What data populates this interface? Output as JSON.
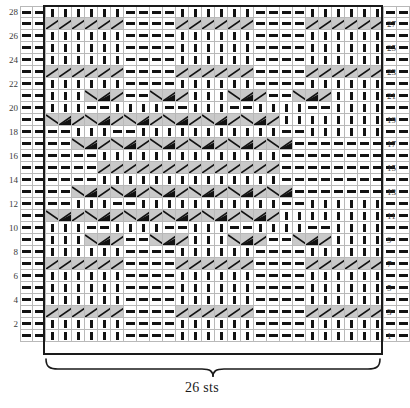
{
  "chart_data": {
    "type": "table",
    "caption": "26 sts",
    "rows_total": 28,
    "columns_total": 30,
    "repeat_columns": 26,
    "repeat_start_column": 3,
    "row_numbers_left": [
      28,
      26,
      24,
      22,
      20,
      18,
      16,
      14,
      12,
      10,
      8,
      6,
      4,
      2
    ],
    "row_numbers_right": [
      27,
      25,
      23,
      21,
      19,
      17,
      15,
      13,
      11,
      9,
      7,
      5,
      3,
      1
    ],
    "xlabel": "26 sts",
    "ylabel": "",
    "grid": true,
    "legend_position": "none",
    "symbol_key": {
      "k": "knit-stitch",
      "p": "purl-stitch",
      "R": "right-traveling-stitch",
      "L": "left-traveling-stitch",
      "RD": "right-twist-dark",
      "LD": "left-twist-dark",
      "b": "blank-gray"
    },
    "colors": {
      "grid_line": "#b9b9b9",
      "repeat_outline": "#1a1a1a",
      "symbol": "#121212",
      "fill_gray": "#c9c9c9",
      "fill_light_gray": "#dedede",
      "fill_white": "#ffffff",
      "text": "#3a3a3a"
    },
    "rows": [
      {
        "n": 28,
        "cells": "pp|kkkkkk|pppp|kkkkkk|pppp|kkkkkk|pp"
      },
      {
        "n": 27,
        "cells": "pp|RRRRRR|pppp|RRRRRR|pppp|RRRRRR|pp"
      },
      {
        "n": 26,
        "cells": "pp|kkkkkk|pppp|kkkkkk|pppp|kkkkkk|pp"
      },
      {
        "n": 25,
        "cells": "pp|kkkkkk|pppp|kkkkkk|pppp|kkkkkk|pp"
      },
      {
        "n": 24,
        "cells": "pp|kkkkkk|pppp|kkkkkk|pppp|kkkkkk|pp"
      },
      {
        "n": 23,
        "cells": "pp|RRRRRR|pppp|RRRRRR|pppp|RRRRRR|pp"
      },
      {
        "n": 22,
        "cells": "pp|kkkkkk|pppp|kkkkkk|pppp|kkkkkk|pp"
      },
      {
        "n": 21,
        "cells": "pp|kkkLDR|ppLDR|kkkLDR|ppLDR|kkkkkk|pp"
      },
      {
        "n": 20,
        "cells": "pp|kkkppk|kkppk|kkkppk|kkppk|kkkkkk|pp"
      },
      {
        "n": 19,
        "cells": "pp|LDRLDR|LDRLDR|LDRLDR|LDRkkk|kkkkkk|pp"
      },
      {
        "n": 18,
        "cells": "pp|ppkkkp|pkkkkk|kkkkkk|kkkppk|kkkkkk|pp"
      },
      {
        "n": 17,
        "cells": "pp|ppLDRL|DRLDRL|DRLDRL|DRLDpp|pppppp|pp"
      },
      {
        "n": 16,
        "cells": "pp|ppppkk|kkkkkk|kkkkkk|kkkkpp|pppppp|pp"
      },
      {
        "n": 15,
        "cells": "pp|ppppRR|RRRRRR|RRRRRR|RRRRpp|pppppp|pp"
      },
      {
        "n": 14,
        "cells": "pp|ppppkk|kkkkkk|kkkkkk|kkkkpp|pppppp|pp"
      },
      {
        "n": 13,
        "cells": "pp|ppLDRL|DRLDRL|DRLDRL|DRLDpp|pppppp|pp"
      },
      {
        "n": 12,
        "cells": "pp|ppkkkp|pkkkkk|kkkkkk|kkkppk|kkkkkk|pp"
      },
      {
        "n": 11,
        "cells": "pp|LDRLDR|LDRLDR|LDRLDR|LDRkkk|kkkkkk|pp"
      },
      {
        "n": 10,
        "cells": "pp|kkkppk|kkppk|kkkppk|kkppk|kkkkkk|pp"
      },
      {
        "n": 9,
        "cells": "pp|kkkLDR|ppLDR|kkkLDR|ppLDR|kkkkkk|pp"
      },
      {
        "n": 8,
        "cells": "pp|kkkkkk|pppp|kkkkkk|pppp|kkkkkk|pp"
      },
      {
        "n": 7,
        "cells": "pp|RRRRRR|pppp|RRRRRR|pppp|RRRRRR|pp"
      },
      {
        "n": 6,
        "cells": "pp|kkkkkk|pppp|kkkkkk|pppp|kkkkkk|pp"
      },
      {
        "n": 5,
        "cells": "pp|kkkkkk|pppp|kkkkkk|pppp|kkkkkk|pp"
      },
      {
        "n": 4,
        "cells": "pp|kkkkkk|pppp|kkkkkk|pppp|kkkkkk|pp"
      },
      {
        "n": 3,
        "cells": "pp|RRRRRR|pppp|RRRRRR|pppp|RRRRRR|pp"
      },
      {
        "n": 2,
        "cells": "pp|kkkkkk|pppp|kkkkkk|pppp|kkkkkk|pp"
      },
      {
        "n": 1,
        "cells": "pp|kkkkkk|pppp|kkkkkk|pppp|kkkkkk|pp"
      }
    ],
    "matrix": [
      [
        "p",
        "p",
        "k",
        "k",
        "k",
        "k",
        "k",
        "k",
        "p",
        "p",
        "p",
        "p",
        "k",
        "k",
        "k",
        "k",
        "k",
        "k",
        "p",
        "p",
        "p",
        "p",
        "k",
        "k",
        "k",
        "k",
        "k",
        "k",
        "p",
        "p"
      ],
      [
        "p",
        "p",
        "R",
        "R",
        "R",
        "R",
        "R",
        "R",
        "p",
        "p",
        "p",
        "p",
        "R",
        "R",
        "R",
        "R",
        "R",
        "R",
        "p",
        "p",
        "p",
        "p",
        "R",
        "R",
        "R",
        "R",
        "R",
        "R",
        "p",
        "p"
      ],
      [
        "p",
        "p",
        "k",
        "k",
        "k",
        "k",
        "k",
        "k",
        "p",
        "p",
        "p",
        "p",
        "k",
        "k",
        "k",
        "k",
        "k",
        "k",
        "p",
        "p",
        "p",
        "p",
        "k",
        "k",
        "k",
        "k",
        "k",
        "k",
        "p",
        "p"
      ],
      [
        "p",
        "p",
        "k",
        "k",
        "k",
        "k",
        "k",
        "k",
        "p",
        "p",
        "p",
        "p",
        "k",
        "k",
        "k",
        "k",
        "k",
        "k",
        "p",
        "p",
        "p",
        "p",
        "k",
        "k",
        "k",
        "k",
        "k",
        "k",
        "p",
        "p"
      ],
      [
        "p",
        "p",
        "k",
        "k",
        "k",
        "k",
        "k",
        "k",
        "p",
        "p",
        "p",
        "p",
        "k",
        "k",
        "k",
        "k",
        "k",
        "k",
        "p",
        "p",
        "p",
        "p",
        "k",
        "k",
        "k",
        "k",
        "k",
        "k",
        "p",
        "p"
      ],
      [
        "p",
        "p",
        "R",
        "R",
        "R",
        "R",
        "R",
        "R",
        "p",
        "p",
        "p",
        "p",
        "R",
        "R",
        "R",
        "R",
        "R",
        "R",
        "p",
        "p",
        "p",
        "p",
        "R",
        "R",
        "R",
        "R",
        "R",
        "R",
        "p",
        "p"
      ],
      [
        "p",
        "p",
        "k",
        "k",
        "k",
        "k",
        "k",
        "k",
        "p",
        "p",
        "p",
        "p",
        "k",
        "k",
        "k",
        "k",
        "k",
        "k",
        "p",
        "p",
        "p",
        "p",
        "k",
        "k",
        "k",
        "k",
        "k",
        "k",
        "p",
        "p"
      ],
      [
        "p",
        "p",
        "k",
        "k",
        "k",
        "L",
        "D",
        "R",
        "p",
        "p",
        "L",
        "D",
        "R",
        "k",
        "k",
        "k",
        "L",
        "D",
        "R",
        "p",
        "p",
        "L",
        "D",
        "R",
        "k",
        "k",
        "k",
        "k",
        "p",
        "p"
      ],
      [
        "p",
        "p",
        "k",
        "k",
        "k",
        "p",
        "p",
        "k",
        "k",
        "k",
        "k",
        "p",
        "p",
        "k",
        "k",
        "k",
        "p",
        "p",
        "k",
        "k",
        "k",
        "k",
        "p",
        "p",
        "k",
        "k",
        "k",
        "k",
        "p",
        "p"
      ],
      [
        "p",
        "p",
        "L",
        "D",
        "R",
        "L",
        "D",
        "R",
        "L",
        "D",
        "R",
        "L",
        "D",
        "R",
        "L",
        "D",
        "R",
        "L",
        "D",
        "R",
        "k",
        "k",
        "k",
        "k",
        "k",
        "k",
        "k",
        "k",
        "p",
        "p"
      ],
      [
        "p",
        "p",
        "p",
        "p",
        "k",
        "k",
        "k",
        "p",
        "p",
        "k",
        "k",
        "k",
        "k",
        "k",
        "k",
        "k",
        "k",
        "k",
        "k",
        "k",
        "p",
        "p",
        "k",
        "k",
        "k",
        "k",
        "k",
        "k",
        "p",
        "p"
      ],
      [
        "p",
        "p",
        "p",
        "p",
        "L",
        "D",
        "R",
        "L",
        "D",
        "R",
        "L",
        "D",
        "R",
        "L",
        "D",
        "R",
        "L",
        "D",
        "R",
        "L",
        "D",
        "p",
        "p",
        "p",
        "p",
        "p",
        "p",
        "p",
        "p",
        "p"
      ],
      [
        "p",
        "p",
        "p",
        "p",
        "p",
        "p",
        "k",
        "k",
        "k",
        "k",
        "k",
        "k",
        "k",
        "k",
        "k",
        "k",
        "k",
        "k",
        "k",
        "k",
        "p",
        "p",
        "p",
        "p",
        "p",
        "p",
        "p",
        "p",
        "p",
        "p"
      ],
      [
        "p",
        "p",
        "p",
        "p",
        "p",
        "p",
        "R",
        "R",
        "R",
        "R",
        "R",
        "R",
        "R",
        "R",
        "R",
        "R",
        "R",
        "R",
        "R",
        "R",
        "p",
        "p",
        "p",
        "p",
        "p",
        "p",
        "p",
        "p",
        "p",
        "p"
      ],
      [
        "p",
        "p",
        "p",
        "p",
        "p",
        "p",
        "k",
        "k",
        "k",
        "k",
        "k",
        "k",
        "k",
        "k",
        "k",
        "k",
        "k",
        "k",
        "k",
        "k",
        "p",
        "p",
        "p",
        "p",
        "p",
        "p",
        "p",
        "p",
        "p",
        "p"
      ],
      [
        "p",
        "p",
        "p",
        "p",
        "L",
        "D",
        "R",
        "L",
        "D",
        "R",
        "L",
        "D",
        "R",
        "L",
        "D",
        "R",
        "L",
        "D",
        "R",
        "L",
        "D",
        "p",
        "p",
        "p",
        "p",
        "p",
        "p",
        "p",
        "p",
        "p"
      ],
      [
        "p",
        "p",
        "p",
        "p",
        "k",
        "k",
        "k",
        "p",
        "p",
        "k",
        "k",
        "k",
        "k",
        "k",
        "k",
        "k",
        "k",
        "k",
        "k",
        "k",
        "p",
        "p",
        "k",
        "k",
        "k",
        "k",
        "k",
        "k",
        "p",
        "p"
      ],
      [
        "p",
        "p",
        "L",
        "D",
        "R",
        "L",
        "D",
        "R",
        "L",
        "D",
        "R",
        "L",
        "D",
        "R",
        "L",
        "D",
        "R",
        "L",
        "D",
        "R",
        "k",
        "k",
        "k",
        "k",
        "k",
        "k",
        "k",
        "k",
        "p",
        "p"
      ],
      [
        "p",
        "p",
        "k",
        "k",
        "k",
        "p",
        "p",
        "k",
        "k",
        "k",
        "k",
        "p",
        "p",
        "k",
        "k",
        "k",
        "p",
        "p",
        "k",
        "k",
        "k",
        "k",
        "p",
        "p",
        "k",
        "k",
        "k",
        "k",
        "p",
        "p"
      ],
      [
        "p",
        "p",
        "k",
        "k",
        "k",
        "L",
        "D",
        "R",
        "p",
        "p",
        "L",
        "D",
        "R",
        "k",
        "k",
        "k",
        "L",
        "D",
        "R",
        "p",
        "p",
        "L",
        "D",
        "R",
        "k",
        "k",
        "k",
        "k",
        "p",
        "p"
      ],
      [
        "p",
        "p",
        "k",
        "k",
        "k",
        "k",
        "k",
        "k",
        "p",
        "p",
        "p",
        "p",
        "k",
        "k",
        "k",
        "k",
        "k",
        "k",
        "p",
        "p",
        "p",
        "p",
        "k",
        "k",
        "k",
        "k",
        "k",
        "k",
        "p",
        "p"
      ],
      [
        "p",
        "p",
        "R",
        "R",
        "R",
        "R",
        "R",
        "R",
        "p",
        "p",
        "p",
        "p",
        "R",
        "R",
        "R",
        "R",
        "R",
        "R",
        "p",
        "p",
        "p",
        "p",
        "R",
        "R",
        "R",
        "R",
        "R",
        "R",
        "p",
        "p"
      ],
      [
        "p",
        "p",
        "k",
        "k",
        "k",
        "k",
        "k",
        "k",
        "p",
        "p",
        "p",
        "p",
        "k",
        "k",
        "k",
        "k",
        "k",
        "k",
        "p",
        "p",
        "p",
        "p",
        "k",
        "k",
        "k",
        "k",
        "k",
        "k",
        "p",
        "p"
      ],
      [
        "p",
        "p",
        "k",
        "k",
        "k",
        "k",
        "k",
        "k",
        "p",
        "p",
        "p",
        "p",
        "k",
        "k",
        "k",
        "k",
        "k",
        "k",
        "p",
        "p",
        "p",
        "p",
        "k",
        "k",
        "k",
        "k",
        "k",
        "k",
        "p",
        "p"
      ],
      [
        "p",
        "p",
        "k",
        "k",
        "k",
        "k",
        "k",
        "k",
        "p",
        "p",
        "p",
        "p",
        "k",
        "k",
        "k",
        "k",
        "k",
        "k",
        "p",
        "p",
        "p",
        "p",
        "k",
        "k",
        "k",
        "k",
        "k",
        "k",
        "p",
        "p"
      ],
      [
        "p",
        "p",
        "R",
        "R",
        "R",
        "R",
        "R",
        "R",
        "p",
        "p",
        "p",
        "p",
        "R",
        "R",
        "R",
        "R",
        "R",
        "R",
        "p",
        "p",
        "p",
        "p",
        "R",
        "R",
        "R",
        "R",
        "R",
        "R",
        "p",
        "p"
      ],
      [
        "p",
        "p",
        "k",
        "k",
        "k",
        "k",
        "k",
        "k",
        "p",
        "p",
        "p",
        "p",
        "k",
        "k",
        "k",
        "k",
        "k",
        "k",
        "p",
        "p",
        "p",
        "p",
        "k",
        "k",
        "k",
        "k",
        "k",
        "k",
        "p",
        "p"
      ],
      [
        "p",
        "p",
        "k",
        "k",
        "k",
        "k",
        "k",
        "k",
        "p",
        "p",
        "p",
        "p",
        "k",
        "k",
        "k",
        "k",
        "k",
        "k",
        "p",
        "p",
        "p",
        "p",
        "k",
        "k",
        "k",
        "k",
        "k",
        "k",
        "p",
        "p"
      ]
    ]
  },
  "footer": {
    "sts_label": "26 sts"
  }
}
